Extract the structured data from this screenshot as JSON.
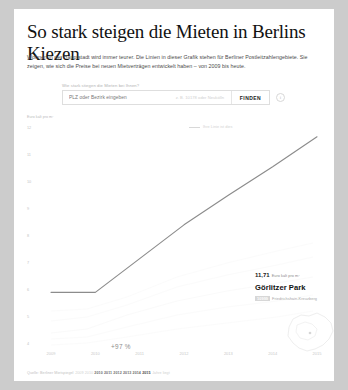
{
  "article": {
    "headline": "So stark steigen die Mieten in Berlins Kiezen",
    "subtitle": "Wohnen in der Hauptstadt wird immer teurer. Die Linien in dieser Grafik stehen für Berliner Postleitzahlengebiete. Sie zeigen, wie sich die Preise bei neuen Mietverträgen entwickelt haben – von 2009 bis heute."
  },
  "search": {
    "label": "Wie stark stiegen die Mieten bei Ihnen?",
    "placeholder": "PLZ oder Bezirk eingeben",
    "value": "",
    "hint": "z. B. 10178 oder Neukölln",
    "button": "FINDEN",
    "info_icon": "i"
  },
  "tooltip": {
    "value": "11,71",
    "unit": "Euro kalt pro m²",
    "name": "Görlitzer Park",
    "plz": "10999",
    "district": "Friedrichshain-Kreuzberg",
    "close": "×"
  },
  "annotation": "+97 %",
  "legend": "Ihre Linie ist dies",
  "footer": {
    "source": "Quelle: Berliner Mietspiegel",
    "years": [
      "2010",
      "2011",
      "2012",
      "2013",
      "2014"
    ],
    "years_dim": [
      "2009",
      "2010"
    ],
    "year_highlight": "2015",
    "tail": "Jahre liegt"
  },
  "chart_data": {
    "type": "line",
    "title": "",
    "xlabel": "",
    "ylabel": "Euro kalt pro m²",
    "x": [
      2009,
      2010,
      2011,
      2012,
      2013,
      2014,
      2015
    ],
    "xticklabels": [
      "2009",
      "2010",
      "2011",
      "2012",
      "2013",
      "2014",
      "2015"
    ],
    "yticklabels": [
      "12",
      "10",
      "11",
      "10",
      "9",
      "8",
      "7",
      "6",
      "5",
      "4"
    ],
    "yticks": [
      12,
      11,
      10,
      9,
      8,
      7,
      6,
      5,
      4
    ],
    "ylim": [
      4,
      12
    ],
    "xlim": [
      2009,
      2015
    ],
    "grid": false,
    "legend_position": "top-right",
    "series": [
      {
        "name": "Görlitzer Park (10999)",
        "values": [
          5.95,
          5.95,
          7.2,
          8.45,
          9.55,
          10.6,
          11.71
        ],
        "color": "#8c8c8c",
        "highlight": true
      }
    ],
    "annotations": [
      {
        "text": "+97 %",
        "x": 2011.4,
        "y": 7.0
      },
      {
        "text": "11,71",
        "x": 2015,
        "y": 11.71
      }
    ]
  }
}
